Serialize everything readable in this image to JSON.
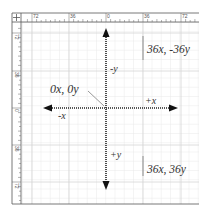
{
  "diagram": {
    "top_ruler": {
      "labels": [
        "72",
        "36",
        "0",
        "36",
        "72"
      ]
    },
    "left_ruler": {
      "labels": [
        "72",
        "36",
        "0",
        "36",
        "72"
      ]
    },
    "origin_label": "0x, 0y",
    "axis_labels": {
      "neg_y": "-y",
      "pos_y": "+y",
      "neg_x": "-x",
      "pos_x": "+x"
    },
    "point_labels": {
      "upper_right": "36x, -36y",
      "lower_right": "36x, 36y"
    },
    "colors": {
      "grid": "#e4e4e4",
      "ruler_line": "#555555",
      "arrow": "#222222",
      "text": "#333333"
    }
  }
}
